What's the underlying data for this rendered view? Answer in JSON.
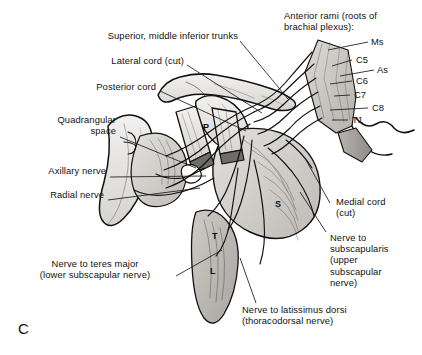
{
  "figure": {
    "panel_letter": "C",
    "background_color": "#ffffff",
    "ink_color": "#111111",
    "leader_color": "#1a1a1a"
  },
  "labels": {
    "left": [
      {
        "id": "superior-middle-inferior-trunks",
        "text": "Superior, middle inferior trunks"
      },
      {
        "id": "lateral-cord-cut",
        "text": "Lateral cord (cut)"
      },
      {
        "id": "posterior-cord",
        "text": "Posterior cord"
      },
      {
        "id": "quadrangular-space",
        "text": "Quadrangular\nspace"
      },
      {
        "id": "axillary-nerve",
        "text": "Axillary nerve"
      },
      {
        "id": "radial-nerve",
        "text": "Radial nerve"
      },
      {
        "id": "nerve-to-teres-major",
        "text": "Nerve to teres major\n(lower subscapular nerve)"
      }
    ],
    "right": [
      {
        "id": "anterior-rami-heading",
        "text": "Anterior rami (roots of\nbrachial plexus):"
      },
      {
        "id": "medial-cord-cut",
        "text": "Medial cord\n(cut)"
      },
      {
        "id": "nerve-to-subscapularis",
        "text": "Nerve to\nsubscapularis\n(upper\nsubscapular\nnerve)"
      }
    ],
    "bottom": [
      {
        "id": "nerve-to-latissimus-dorsi",
        "text": "Nerve to latissimus dorsi\n(thoracodorsal nerve)"
      }
    ]
  },
  "roots": [
    {
      "id": "root-ms",
      "text": "Ms"
    },
    {
      "id": "root-c5",
      "text": "C5"
    },
    {
      "id": "root-as",
      "text": "As"
    },
    {
      "id": "root-c6",
      "text": "C6"
    },
    {
      "id": "root-c7",
      "text": "C7"
    },
    {
      "id": "root-c8",
      "text": "C8"
    },
    {
      "id": "root-t1",
      "text": "T1"
    }
  ],
  "muscle_markers": [
    {
      "id": "marker-p",
      "text": "P"
    },
    {
      "id": "marker-s",
      "text": "S"
    },
    {
      "id": "marker-t",
      "text": "T"
    },
    {
      "id": "marker-l",
      "text": "L"
    }
  ]
}
